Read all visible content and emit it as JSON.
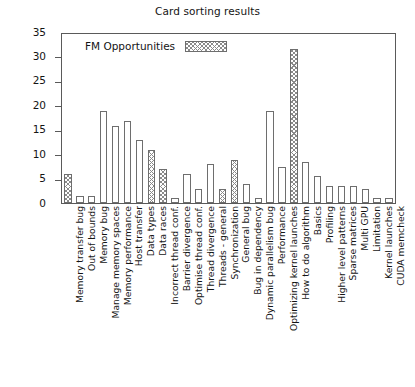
{
  "chart_data": {
    "type": "bar",
    "title": "Card sorting results",
    "xlabel": "",
    "ylabel": "nr. of Questions",
    "ylim": [
      0,
      35
    ],
    "yticks": [
      0,
      5,
      10,
      15,
      20,
      25,
      30,
      35
    ],
    "grid": false,
    "legend": {
      "position": "top-left-inside",
      "entries": [
        {
          "label": "FM Opportunities",
          "pattern": "cross-hatch"
        }
      ]
    },
    "categories": [
      "Memory transfer bug",
      "Out of bounds",
      "Memory bug",
      "Manage memory spaces",
      "Memory performance",
      "Host transfer",
      "Data types",
      "Data races",
      "Incorrect thread conf.",
      "Barrier divergence",
      "Optimise thread conf.",
      "Thread divergence",
      "Threads - general",
      "Synchronization",
      "General bug",
      "Bug in dependency",
      "Dynamic parallelism bug",
      "Performance",
      "Optimizing kernel launches",
      "How to do algorithm",
      "Basics",
      "Profiling",
      "Higher level patterns",
      "Sparse matrices",
      "Multi GPU",
      "Limitation",
      "Kernel launches",
      "CUDA memcheck"
    ],
    "values": [
      6,
      1.5,
      1.5,
      19,
      16,
      17,
      13,
      11,
      7,
      1,
      6,
      3,
      8,
      3,
      9,
      4,
      1,
      19,
      7.5,
      32,
      8.5,
      5.5,
      3.5,
      3.5,
      3.5,
      3,
      1,
      1
    ],
    "fm_opportunity": [
      true,
      false,
      false,
      false,
      false,
      false,
      false,
      true,
      true,
      false,
      false,
      false,
      false,
      true,
      true,
      false,
      false,
      false,
      false,
      true,
      false,
      false,
      false,
      false,
      false,
      false,
      false,
      false
    ],
    "colors": {
      "bar_outline": "#6e6e6e",
      "bar_fill": "#ffffff",
      "hatch": "#8a8a8a",
      "axis": "#5a5a5a",
      "text": "#141414",
      "background": "#ffffff"
    }
  }
}
